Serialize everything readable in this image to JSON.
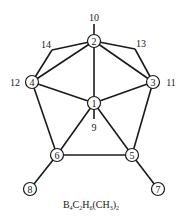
{
  "diagram": {
    "type": "molecular-structure",
    "formula": {
      "text": "B4C2H6(CH3)2",
      "parts": [
        {
          "t": "B",
          "sub": "4"
        },
        {
          "t": "C",
          "sub": "2"
        },
        {
          "t": "H",
          "sub": "6"
        },
        {
          "t": "(CH",
          "sub": "3"
        },
        {
          "t": ")",
          "sub": "2"
        }
      ]
    },
    "nodes": [
      {
        "id": "1",
        "label": "1",
        "x": 94,
        "y": 103,
        "circled": true
      },
      {
        "id": "2",
        "label": "2",
        "x": 94,
        "y": 41,
        "circled": true
      },
      {
        "id": "3",
        "label": "3",
        "x": 153,
        "y": 82,
        "circled": true
      },
      {
        "id": "4",
        "label": "4",
        "x": 32,
        "y": 82,
        "circled": true
      },
      {
        "id": "5",
        "label": "5",
        "x": 132,
        "y": 155,
        "circled": true
      },
      {
        "id": "6",
        "label": "6",
        "x": 57,
        "y": 155,
        "circled": true
      },
      {
        "id": "7",
        "label": "7",
        "x": 158,
        "y": 189,
        "circled": true
      },
      {
        "id": "8",
        "label": "8",
        "x": 30,
        "y": 189,
        "circled": true
      }
    ],
    "points": [
      {
        "id": "10",
        "label": "10",
        "x": 94,
        "y": 18,
        "lx": 94,
        "ly": 18
      },
      {
        "id": "9",
        "label": "9",
        "x": 94,
        "y": 118,
        "lx": 94,
        "ly": 127
      },
      {
        "id": "11",
        "label": "11",
        "x": 163,
        "y": 82,
        "lx": 171,
        "ly": 82
      },
      {
        "id": "12",
        "label": "12",
        "x": 22,
        "y": 82,
        "lx": 15,
        "ly": 82
      },
      {
        "id": "13",
        "label": "13",
        "x": 135,
        "y": 49,
        "lx": 141,
        "ly": 43
      },
      {
        "id": "14",
        "label": "14",
        "x": 52,
        "y": 50,
        "lx": 46,
        "ly": 44
      }
    ],
    "edges": [
      [
        "2",
        "10"
      ],
      [
        "2",
        "4"
      ],
      [
        "2",
        "3"
      ],
      [
        "2",
        "1"
      ],
      [
        "2",
        "14"
      ],
      [
        "14",
        "4"
      ],
      [
        "2",
        "13"
      ],
      [
        "13",
        "3"
      ],
      [
        "4",
        "1"
      ],
      [
        "3",
        "1"
      ],
      [
        "1",
        "9"
      ],
      [
        "4",
        "6"
      ],
      [
        "3",
        "5"
      ],
      [
        "1",
        "6"
      ],
      [
        "1",
        "5"
      ],
      [
        "6",
        "5"
      ],
      [
        "6",
        "8"
      ],
      [
        "5",
        "7"
      ]
    ]
  }
}
